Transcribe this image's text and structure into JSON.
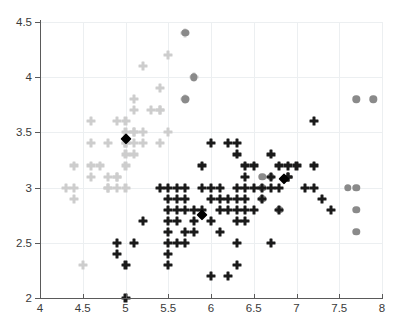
{
  "chart_data": {
    "type": "scatter",
    "title": "",
    "xlabel": "",
    "ylabel": "",
    "xlim": [
      4,
      8
    ],
    "ylim": [
      2,
      4.5
    ],
    "xticks": [
      "4",
      "4.5",
      "5",
      "5.5",
      "6",
      "6.5",
      "7",
      "7.5",
      "8"
    ],
    "xtick_values": [
      4,
      4.5,
      5,
      5.5,
      6,
      6.5,
      7,
      7.5,
      8
    ],
    "yticks": [
      "2",
      "2.5",
      "3",
      "3.5",
      "4",
      "4.5"
    ],
    "ytick_values": [
      2,
      2.5,
      3,
      3.5,
      4,
      4.5
    ],
    "grid": true,
    "legend": "none",
    "colors": {
      "cluster1": "#cdcdcd",
      "cluster2": "#8a8a8a",
      "cluster3": "#1a1a1a",
      "centroid": "#000000",
      "axis": "#5a5a5a",
      "grid": "#eceff1",
      "background": "#ffffff"
    },
    "series": [
      {
        "name": "cluster1",
        "marker": "cross",
        "color": "#cdcdcd",
        "points": [
          [
            4.3,
            3.0
          ],
          [
            4.4,
            2.9
          ],
          [
            4.4,
            3.0
          ],
          [
            4.4,
            3.2
          ],
          [
            4.5,
            2.3
          ],
          [
            4.6,
            3.1
          ],
          [
            4.6,
            3.4
          ],
          [
            4.6,
            3.6
          ],
          [
            4.6,
            3.2
          ],
          [
            4.7,
            3.2
          ],
          [
            4.8,
            3.0
          ],
          [
            4.8,
            3.4
          ],
          [
            4.8,
            3.1
          ],
          [
            4.8,
            3.0
          ],
          [
            4.9,
            3.0
          ],
          [
            4.9,
            3.1
          ],
          [
            4.9,
            3.6
          ],
          [
            4.9,
            3.1
          ],
          [
            5.0,
            3.0
          ],
          [
            5.0,
            3.2
          ],
          [
            5.0,
            3.4
          ],
          [
            5.0,
            3.5
          ],
          [
            5.0,
            3.3
          ],
          [
            5.0,
            3.6
          ],
          [
            5.0,
            3.4
          ],
          [
            5.1,
            3.5
          ],
          [
            5.1,
            3.8
          ],
          [
            5.1,
            3.7
          ],
          [
            5.1,
            3.3
          ],
          [
            5.1,
            3.4
          ],
          [
            5.1,
            3.5
          ],
          [
            5.2,
            3.5
          ],
          [
            5.2,
            3.4
          ],
          [
            5.2,
            4.1
          ],
          [
            5.3,
            3.7
          ],
          [
            5.4,
            3.9
          ],
          [
            5.4,
            3.7
          ],
          [
            5.4,
            3.4
          ],
          [
            5.4,
            3.7
          ],
          [
            5.5,
            4.2
          ],
          [
            5.5,
            3.5
          ],
          [
            5.7,
            4.4
          ],
          [
            5.7,
            3.8
          ],
          [
            5.8,
            4.0
          ]
        ]
      },
      {
        "name": "cluster2",
        "marker": "circle",
        "color": "#8a8a8a",
        "points": [
          [
            5.7,
            4.4
          ],
          [
            5.8,
            4.0
          ],
          [
            5.7,
            3.8
          ],
          [
            6.6,
            3.1
          ],
          [
            6.7,
            3.1
          ],
          [
            6.6,
            3.0
          ],
          [
            6.6,
            2.9
          ],
          [
            6.8,
            2.8
          ],
          [
            7.6,
            3.0
          ],
          [
            7.7,
            3.0
          ],
          [
            7.7,
            2.8
          ],
          [
            7.7,
            2.6
          ],
          [
            7.7,
            3.8
          ],
          [
            7.9,
            3.8
          ]
        ]
      },
      {
        "name": "cluster3",
        "marker": "cross",
        "color": "#1a1a1a",
        "points": [
          [
            4.9,
            2.5
          ],
          [
            4.9,
            2.4
          ],
          [
            5.0,
            2.3
          ],
          [
            5.0,
            2.0
          ],
          [
            5.1,
            2.5
          ],
          [
            5.2,
            2.7
          ],
          [
            5.4,
            3.0
          ],
          [
            5.5,
            2.6
          ],
          [
            5.5,
            2.5
          ],
          [
            5.5,
            2.4
          ],
          [
            5.5,
            2.3
          ],
          [
            5.5,
            3.0
          ],
          [
            5.5,
            2.9
          ],
          [
            5.5,
            2.8
          ],
          [
            5.5,
            2.7
          ],
          [
            5.6,
            3.0
          ],
          [
            5.6,
            2.9
          ],
          [
            5.6,
            2.8
          ],
          [
            5.6,
            2.5
          ],
          [
            5.6,
            2.7
          ],
          [
            5.7,
            3.0
          ],
          [
            5.7,
            2.9
          ],
          [
            5.7,
            2.8
          ],
          [
            5.7,
            2.6
          ],
          [
            5.7,
            2.5
          ],
          [
            5.8,
            2.8
          ],
          [
            5.8,
            2.7
          ],
          [
            5.8,
            2.6
          ],
          [
            5.9,
            3.0
          ],
          [
            5.9,
            3.2
          ],
          [
            5.9,
            2.8
          ],
          [
            6.0,
            3.4
          ],
          [
            6.0,
            3.0
          ],
          [
            6.0,
            2.9
          ],
          [
            6.0,
            2.7
          ],
          [
            6.0,
            2.2
          ],
          [
            6.1,
            3.0
          ],
          [
            6.1,
            2.9
          ],
          [
            6.1,
            2.8
          ],
          [
            6.1,
            2.6
          ],
          [
            6.2,
            3.4
          ],
          [
            6.2,
            2.9
          ],
          [
            6.2,
            2.8
          ],
          [
            6.2,
            2.2
          ],
          [
            6.3,
            3.4
          ],
          [
            6.3,
            3.3
          ],
          [
            6.3,
            3.0
          ],
          [
            6.3,
            2.9
          ],
          [
            6.3,
            2.8
          ],
          [
            6.3,
            2.7
          ],
          [
            6.3,
            2.5
          ],
          [
            6.3,
            2.3
          ],
          [
            6.4,
            3.2
          ],
          [
            6.4,
            3.1
          ],
          [
            6.4,
            2.9
          ],
          [
            6.4,
            2.8
          ],
          [
            6.4,
            2.7
          ],
          [
            6.4,
            3.0
          ],
          [
            6.5,
            3.2
          ],
          [
            6.5,
            3.0
          ],
          [
            6.5,
            2.8
          ],
          [
            6.6,
            3.0
          ],
          [
            6.6,
            2.9
          ],
          [
            6.7,
            3.3
          ],
          [
            6.7,
            3.0
          ],
          [
            6.7,
            3.1
          ],
          [
            6.8,
            3.2
          ],
          [
            6.8,
            3.0
          ],
          [
            6.8,
            2.8
          ],
          [
            6.9,
            3.2
          ],
          [
            6.9,
            3.1
          ],
          [
            7.0,
            3.2
          ],
          [
            7.1,
            3.0
          ],
          [
            7.2,
            3.6
          ],
          [
            7.2,
            3.2
          ],
          [
            7.2,
            3.0
          ],
          [
            7.3,
            2.9
          ],
          [
            7.4,
            2.8
          ],
          [
            6.7,
            2.5
          ],
          [
            6.9,
            3.1
          ]
        ]
      },
      {
        "name": "centroids",
        "marker": "diamond",
        "color": "#000000",
        "points": [
          [
            5.0,
            3.44
          ],
          [
            5.89,
            2.75
          ],
          [
            6.85,
            3.08
          ]
        ]
      }
    ]
  }
}
